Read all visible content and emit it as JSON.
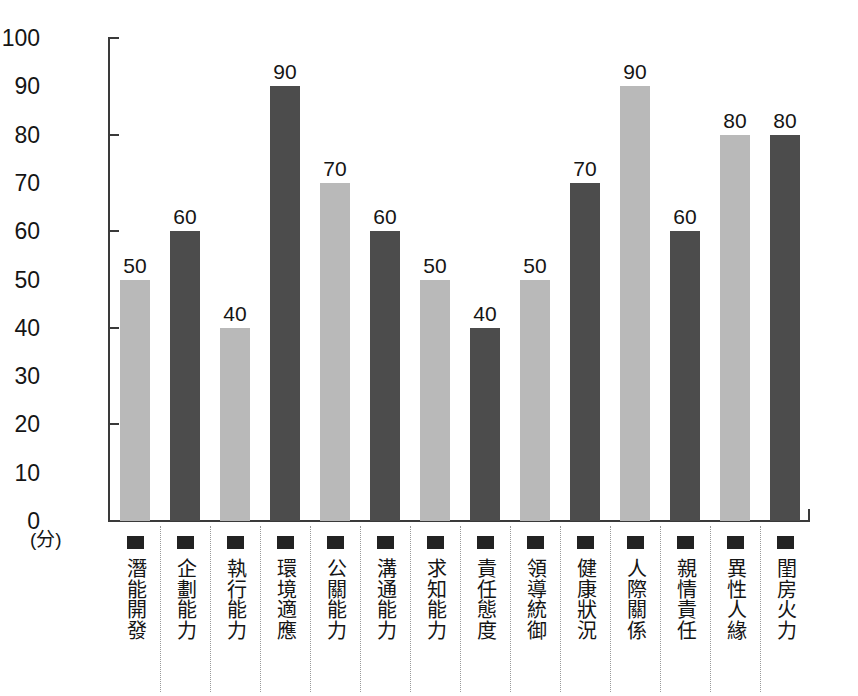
{
  "chart_data": {
    "type": "bar",
    "title": "",
    "xlabel": "",
    "ylabel": "(分)",
    "ylim": [
      0,
      100
    ],
    "grid": false,
    "legend": "none",
    "y_ticks": [
      100,
      90,
      80,
      70,
      60,
      50,
      40,
      30,
      20,
      10,
      0
    ],
    "y_ticks_with_marks": [
      100,
      80,
      60,
      40,
      20,
      0
    ],
    "categories": [
      "潛能開發",
      "企劃能力",
      "執行能力",
      "環境適應",
      "公關能力",
      "溝通能力",
      "求知能力",
      "責任態度",
      "領導統御",
      "健康狀況",
      "人際關係",
      "親情責任",
      "異性人緣",
      "閨房火力"
    ],
    "values": [
      50,
      60,
      40,
      90,
      70,
      60,
      50,
      40,
      50,
      70,
      90,
      60,
      80,
      80
    ],
    "bar_colors": [
      "light",
      "dark",
      "light",
      "dark",
      "light",
      "dark",
      "light",
      "dark",
      "light",
      "dark",
      "light",
      "dark",
      "light",
      "dark"
    ],
    "value_labels": [
      "50",
      "60",
      "40",
      "90",
      "70",
      "60",
      "50",
      "40",
      "50",
      "70",
      "90",
      "60",
      "80",
      "80"
    ],
    "colors": {
      "light_bar": "#b9b9b9",
      "dark_bar": "#4c4c4c",
      "axis": "#3a3a3a",
      "text": "#151515",
      "legend_swatch": "#222222",
      "divider": "#9a9a9a",
      "background": "#ffffff"
    }
  }
}
